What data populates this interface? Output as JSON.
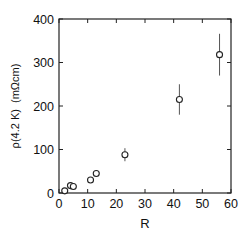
{
  "chart_data": {
    "type": "scatter",
    "title": "",
    "xlabel": "R",
    "ylabel": "ρ(4.2 K)  (mΩcm)",
    "xlim": [
      0,
      60
    ],
    "ylim": [
      0,
      400
    ],
    "x_ticks": [
      0,
      10,
      20,
      30,
      40,
      50,
      60
    ],
    "y_ticks": [
      0,
      100,
      200,
      300,
      400
    ],
    "x_tick_labels": [
      "0",
      "10",
      "20",
      "30",
      "40",
      "50",
      "60"
    ],
    "y_tick_labels": [
      "0",
      "100",
      "200",
      "300",
      "400"
    ],
    "grid": false,
    "legend": null,
    "marker": "open-circle",
    "series": [
      {
        "name": "ρ(4.2 K)",
        "points": [
          {
            "x": 2,
            "y": 5,
            "err": 0
          },
          {
            "x": 4,
            "y": 17,
            "err": 0
          },
          {
            "x": 5,
            "y": 15,
            "err": 0
          },
          {
            "x": 11,
            "y": 30,
            "err": 0
          },
          {
            "x": 13,
            "y": 45,
            "err": 0
          },
          {
            "x": 23,
            "y": 88,
            "err": 15
          },
          {
            "x": 42,
            "y": 215,
            "err": 35
          },
          {
            "x": 56,
            "y": 318,
            "err": 48
          }
        ]
      }
    ]
  },
  "colors": {
    "axis": "#222222",
    "marker": "#222222",
    "errorbar": "#555555",
    "background": "#ffffff"
  }
}
